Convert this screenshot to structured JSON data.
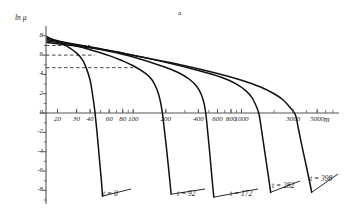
{
  "figure": {
    "panel_label": "a",
    "axis_label_y": "ln μ",
    "axis_label_x": "m"
  },
  "chart_data": {
    "type": "line",
    "title": "",
    "subtitle": "",
    "panel_label": "a",
    "xlabel": "m",
    "ylabel": "ln μ",
    "xscale": "log",
    "yscale": "linear",
    "xlim": [
      15,
      7000
    ],
    "ylim": [
      -9,
      8.6
    ],
    "grid": false,
    "legend": "inline-curve-labels",
    "xticks": [
      20,
      30,
      40,
      60,
      80,
      100,
      200,
      400,
      600,
      800,
      1000,
      3000,
      5000
    ],
    "xtick_labels": [
      "20",
      "30",
      "40",
      "60",
      "80",
      "100",
      "200",
      "400",
      "600",
      "800",
      "1000",
      "3000",
      "5000"
    ],
    "yticks": [
      8,
      6,
      4,
      2,
      0,
      -2,
      -4,
      -6,
      -8
    ],
    "ytick_labels": [
      "8",
      "6",
      "4",
      "2",
      "0",
      "-2",
      "-4",
      "-6",
      "-8"
    ],
    "ytick_minor_step": 1,
    "reference_lines": [
      {
        "type": "horizontal-dashed",
        "y": 7.0,
        "x_from": 15,
        "x_to": 40
      },
      {
        "type": "horizontal-dashed",
        "y": 6.0,
        "x_from": 15,
        "x_to": 44
      },
      {
        "type": "horizontal-dashed",
        "y": 4.7,
        "x_from": 15,
        "x_to": 100
      }
    ],
    "series": [
      {
        "name": "t = 0",
        "label": "t = 0",
        "t": 0,
        "zero_crossing_x": 45,
        "points": [
          [
            16,
            7.9
          ],
          [
            20,
            7.4
          ],
          [
            25,
            6.85
          ],
          [
            30,
            6.2
          ],
          [
            34,
            5.5
          ],
          [
            37,
            4.6
          ],
          [
            40,
            3.4
          ],
          [
            42,
            2.0
          ],
          [
            44,
            0.4
          ],
          [
            45,
            -0.6
          ],
          [
            46.5,
            -2.2
          ],
          [
            48,
            -3.9
          ],
          [
            49.5,
            -5.6
          ],
          [
            51,
            -7.2
          ],
          [
            52,
            -8.6
          ]
        ]
      },
      {
        "name": "t = 92",
        "label": "t = 92",
        "t": 92,
        "zero_crossing_x": 185,
        "points": [
          [
            16,
            7.75
          ],
          [
            25,
            7.2
          ],
          [
            40,
            6.55
          ],
          [
            60,
            5.95
          ],
          [
            80,
            5.4
          ],
          [
            100,
            4.9
          ],
          [
            130,
            4.1
          ],
          [
            150,
            3.4
          ],
          [
            165,
            2.5
          ],
          [
            175,
            1.6
          ],
          [
            185,
            0.2
          ],
          [
            192,
            -1.3
          ],
          [
            200,
            -3.0
          ],
          [
            208,
            -4.8
          ],
          [
            216,
            -6.6
          ],
          [
            224,
            -8.4
          ]
        ]
      },
      {
        "name": "t = 172",
        "label": "t = 172",
        "t": 172,
        "zero_crossing_x": 470,
        "points": [
          [
            16,
            7.6
          ],
          [
            30,
            7.1
          ],
          [
            60,
            6.4
          ],
          [
            100,
            5.8
          ],
          [
            180,
            4.9
          ],
          [
            260,
            4.2
          ],
          [
            330,
            3.5
          ],
          [
            390,
            2.7
          ],
          [
            430,
            1.8
          ],
          [
            455,
            0.8
          ],
          [
            470,
            -0.2
          ],
          [
            487,
            -1.9
          ],
          [
            505,
            -3.7
          ],
          [
            522,
            -5.5
          ],
          [
            540,
            -7.3
          ],
          [
            555,
            -8.7
          ]
        ]
      },
      {
        "name": "t = 282",
        "label": "t = 282",
        "t": 282,
        "zero_crossing_x": 1450,
        "points": [
          [
            16,
            7.45
          ],
          [
            40,
            6.85
          ],
          [
            100,
            6.0
          ],
          [
            200,
            5.25
          ],
          [
            400,
            4.4
          ],
          [
            650,
            3.7
          ],
          [
            900,
            3.0
          ],
          [
            1100,
            2.3
          ],
          [
            1250,
            1.6
          ],
          [
            1370,
            0.7
          ],
          [
            1450,
            -0.1
          ],
          [
            1520,
            -1.5
          ],
          [
            1600,
            -3.2
          ],
          [
            1690,
            -5.0
          ],
          [
            1780,
            -6.7
          ],
          [
            1860,
            -8.2
          ]
        ]
      },
      {
        "name": "t = 398",
        "label": "t = 398",
        "t": 398,
        "zero_crossing_x": 3150,
        "points": [
          [
            16,
            7.3
          ],
          [
            50,
            6.6
          ],
          [
            120,
            5.8
          ],
          [
            300,
            4.9
          ],
          [
            600,
            4.1
          ],
          [
            1000,
            3.4
          ],
          [
            1500,
            2.7
          ],
          [
            2000,
            2.0
          ],
          [
            2400,
            1.4
          ],
          [
            2800,
            0.6
          ],
          [
            3150,
            -0.2
          ],
          [
            3350,
            -1.6
          ],
          [
            3600,
            -3.3
          ],
          [
            3900,
            -5.1
          ],
          [
            4200,
            -6.8
          ],
          [
            4450,
            -8.2
          ]
        ]
      }
    ],
    "curve_label_positions": [
      {
        "label": "t = 0",
        "x_px": 103,
        "y_px": 190
      },
      {
        "label": "t = 92",
        "x_px": 177,
        "y_px": 190
      },
      {
        "label": "t = 172",
        "x_px": 230,
        "y_px": 190
      },
      {
        "label": "t = 282",
        "x_px": 272,
        "y_px": 182
      },
      {
        "label": "t = 398",
        "x_px": 310,
        "y_px": 175
      }
    ]
  }
}
